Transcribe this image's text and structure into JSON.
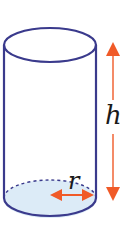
{
  "diagram": {
    "type": "cylinder",
    "labels": {
      "height": "h",
      "radius": "r"
    },
    "colors": {
      "outline": "#3a3a8c",
      "arrow": "#f05a28",
      "base_fill": "#dcebf7",
      "text": "#1a1a1a"
    }
  }
}
